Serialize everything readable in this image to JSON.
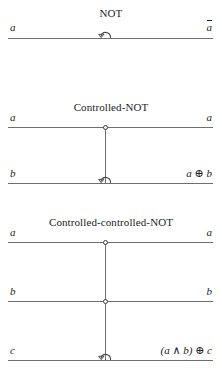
{
  "figure": {
    "kind": "reversible-logic-gate-diagram",
    "line_color": "#6f6f6f",
    "text_color": "#1c1c1c",
    "symbols": {
      "not_gate": "not-hook-arrow",
      "control": "open-control-circle",
      "xor": "⊕",
      "and": "∧"
    }
  },
  "gates": [
    {
      "id": "not",
      "title": "NOT",
      "wires": [
        {
          "input": "a",
          "output": "ā",
          "output_has_overbar": true,
          "output_base": "a"
        }
      ]
    },
    {
      "id": "cnot",
      "title": "Controlled-NOT",
      "wires": [
        {
          "input": "a",
          "output": "a",
          "role": "control"
        },
        {
          "input": "b",
          "output": "a ⊕ b",
          "role": "target"
        }
      ]
    },
    {
      "id": "ccnot",
      "title": "Controlled-controlled-NOT",
      "wires": [
        {
          "input": "a",
          "output": "a",
          "role": "control"
        },
        {
          "input": "b",
          "output": "b",
          "role": "control"
        },
        {
          "input": "c",
          "output": "(a ∧ b) ⊕ c",
          "role": "target"
        }
      ]
    }
  ]
}
